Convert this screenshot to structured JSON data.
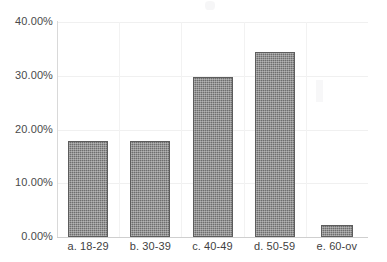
{
  "chart_data": {
    "type": "bar",
    "title": "",
    "subtitle": "",
    "xlabel": "",
    "ylabel": "",
    "categories": [
      "a.  18-29",
      "b. 30-39",
      "c. 40-49",
      "d. 50-59",
      "e. 60-ov"
    ],
    "values": [
      17.9,
      17.9,
      29.7,
      34.4,
      2.2
    ],
    "value_labels": [
      "17.90%",
      "17.90%",
      "29.70%",
      "34.40%",
      "2.20%"
    ],
    "ylim": [
      0,
      40
    ],
    "ytick_labels": [
      "40.00%",
      "30.00%",
      "20.00%",
      "10.00%",
      "0.00%"
    ],
    "ytick_values": [
      40,
      30,
      20,
      10,
      0
    ],
    "grid": {
      "horizontal": true,
      "vertical": true,
      "color": "#f0f0f0"
    },
    "legend": {
      "visible": false,
      "position": "none",
      "entries": []
    },
    "series": [
      {
        "name": "Percent of respondents",
        "values": [
          17.9,
          17.9,
          29.7,
          34.4,
          2.2
        ],
        "color": "#6e6e6e"
      }
    ],
    "bar_color": "#6e6e6e",
    "bar_edge_color": "#5d5d5d",
    "background_color": "#ffffff",
    "axis_color": "#d9d9d9",
    "tick_label_color": "#4a4a4a"
  }
}
